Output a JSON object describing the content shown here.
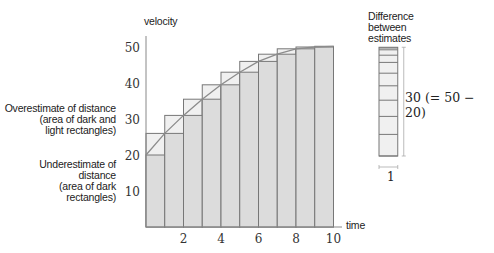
{
  "chart_data": {
    "type": "bar",
    "title": "",
    "xlabel": "time",
    "ylabel": "velocity",
    "xlim": [
      0,
      10
    ],
    "ylim": [
      0,
      53
    ],
    "x_ticks": [
      "2",
      "4",
      "6",
      "8",
      "10"
    ],
    "y_ticks": [
      "10",
      "20",
      "30",
      "40",
      "50"
    ],
    "grid": false,
    "curve": {
      "name": "velocity curve",
      "x": [
        0,
        1,
        2,
        3,
        4,
        5,
        6,
        7,
        8,
        9,
        10
      ],
      "y": [
        20,
        26,
        31,
        35.5,
        39.5,
        43,
        46,
        48,
        49.5,
        50,
        50.2
      ]
    },
    "series": [
      {
        "name": "Underestimate (dark rectangles, left endpoints)",
        "values": [
          20,
          26,
          31,
          35.5,
          39.5,
          43,
          46,
          48,
          49.5,
          50
        ]
      },
      {
        "name": "Overestimate (dark + light rectangles, right endpoints)",
        "values": [
          26,
          31,
          35.5,
          39.5,
          43,
          46,
          48,
          49.5,
          50,
          50.2
        ]
      }
    ],
    "categories": [
      "0-1",
      "1-2",
      "2-3",
      "3-4",
      "4-5",
      "5-6",
      "6-7",
      "7-8",
      "8-9",
      "9-10"
    ],
    "annotations": {
      "overestimate": [
        "Overestimate of distance",
        "(area of dark and",
        "light rectangles)"
      ],
      "underestimate": [
        "Underestimate of distance",
        "(area of dark",
        "rectangles)"
      ],
      "difference_title": [
        "Difference",
        "between",
        "estimates"
      ],
      "difference_height": "30 (= 50 − 20)",
      "difference_width": "1"
    }
  },
  "colors": {
    "dark_rect": "#dcdcdc",
    "light_rect": "#f0f0f0",
    "stroke": "#777777",
    "curve": "#8c8c8c"
  }
}
